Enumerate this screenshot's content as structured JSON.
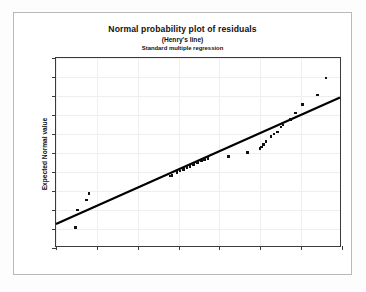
{
  "chart_data": {
    "type": "scatter",
    "title": "Normal probability plot of residuals",
    "subtitle": "(Henry's line)",
    "subtitle2": "Standard multiple regression",
    "xlabel": "Residuals",
    "ylabel": "Expected Normal value",
    "xlim": [
      -40,
      30
    ],
    "ylim": [
      -2.5,
      2.5
    ],
    "xticks": [
      -40,
      -30,
      -20,
      -10,
      0,
      10,
      20,
      30
    ],
    "xtick_labels": [
      "-40",
      "-30",
      "-20",
      "-10",
      "0",
      "10",
      "20",
      "30"
    ],
    "yticks": [
      2.5,
      2.0,
      1.5,
      1.0,
      0.5,
      0.0,
      -0.5,
      -1.0,
      -1.5,
      -2.0,
      -2.5
    ],
    "ytick_labels": [
      "2.5",
      "2.0",
      "1.5",
      "1.0",
      "0.5",
      "0.0",
      "-0.5",
      "-1.0",
      "-1.5",
      "-2.0",
      "-2.5"
    ],
    "grid": true,
    "legend": null,
    "series": [
      {
        "name": "residual quantiles",
        "marker": "filled-square",
        "color": "#111111",
        "points": [
          [
            -35.2,
            -1.96
          ],
          [
            -34.8,
            -1.5
          ],
          [
            -32.6,
            -1.24
          ],
          [
            -31.9,
            -1.07
          ],
          [
            -12.1,
            -0.61
          ],
          [
            -11.6,
            -0.59
          ],
          [
            -10.4,
            -0.52
          ],
          [
            -9.6,
            -0.47
          ],
          [
            -8.8,
            -0.43
          ],
          [
            -7.9,
            -0.38
          ],
          [
            -7.2,
            -0.36
          ],
          [
            -6.4,
            -0.31
          ],
          [
            -5.3,
            -0.25
          ],
          [
            -4.4,
            -0.21
          ],
          [
            -3.6,
            -0.17
          ],
          [
            -2.8,
            -0.14
          ],
          [
            2.2,
            -0.09
          ],
          [
            6.8,
            0.01
          ],
          [
            9.9,
            0.12
          ],
          [
            10.3,
            0.16
          ],
          [
            10.8,
            0.23
          ],
          [
            11.4,
            0.3
          ],
          [
            12.6,
            0.43
          ],
          [
            13.4,
            0.5
          ],
          [
            14.2,
            0.55
          ],
          [
            15.1,
            0.68
          ],
          [
            15.6,
            0.74
          ],
          [
            17.4,
            0.88
          ],
          [
            18.6,
            1.05
          ],
          [
            20.3,
            1.28
          ],
          [
            24.0,
            1.53
          ],
          [
            26.1,
            1.97
          ]
        ]
      }
    ],
    "reference_line": {
      "name": "Henry's line",
      "color": "#000000",
      "x0": -40,
      "y0": -1.9,
      "x1": 30,
      "y1": 1.45
    }
  }
}
